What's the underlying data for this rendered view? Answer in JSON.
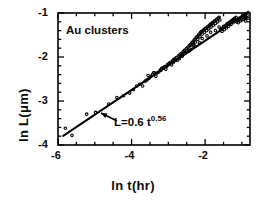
{
  "figure": {
    "series_label": "Au clusters",
    "fit_label_base": "L=0.6 t",
    "fit_label_exponent": "0.56"
  },
  "chart_data": {
    "type": "scatter",
    "title": "",
    "xlabel": "ln t(hr)",
    "ylabel": "ln L(μm)",
    "xlim": [
      -6.0,
      -0.78
    ],
    "ylim": [
      -4.0,
      -1.0
    ],
    "grid": false,
    "legend": "none",
    "xticks_major": [
      -6,
      -4,
      -2
    ],
    "xtick_labels": [
      "-6",
      "-4",
      "-2"
    ],
    "xticks_minor_step": 0.5,
    "yticks_major": [
      -1,
      -2,
      -3,
      -4
    ],
    "ytick_labels": [
      "-1",
      "-2",
      "-3",
      "-4"
    ],
    "yticks_minor_step": 0.2,
    "tick_direction": "in",
    "marker": "open-circle",
    "marker_size_px": 2.6,
    "annotations": [
      {
        "text": "Au clusters",
        "x": -5.35,
        "y": -1.33
      },
      {
        "text": "L=0.6 t^0.56",
        "x": -4.2,
        "y": -3.42
      }
    ],
    "fit": {
      "equation": "L = 0.6 t^0.56",
      "form": "power-law",
      "prefactor": 0.6,
      "exponent": 0.56,
      "log_slope": 0.56,
      "log_intercept": -0.511,
      "x_start": -5.86,
      "x_end": -0.82
    },
    "series": [
      {
        "name": "Au clusters",
        "x": [
          -5.8,
          -5.62,
          -5.22,
          -4.98,
          -4.62,
          -4.4,
          -4.22,
          -4.05,
          -3.95,
          -3.86,
          -3.78,
          -3.7,
          -3.63,
          -3.58,
          -3.52,
          -3.47,
          -3.43,
          -3.38,
          -3.34,
          -3.3,
          -3.26,
          -3.22,
          -3.18,
          -3.14,
          -3.1,
          -3.07,
          -3.03,
          -3.0,
          -2.97,
          -2.94,
          -2.91,
          -2.88,
          -2.85,
          -2.82,
          -2.79,
          -2.76,
          -2.73,
          -2.7,
          -2.67,
          -2.65,
          -2.62,
          -2.6,
          -2.57,
          -2.55,
          -2.52,
          -2.5,
          -2.47,
          -2.45,
          -2.43,
          -2.4,
          -2.38,
          -2.36,
          -2.34,
          -2.32,
          -2.3,
          -2.28,
          -2.26,
          -2.24,
          -2.22,
          -2.2,
          -2.18,
          -2.16,
          -2.14,
          -2.12,
          -2.1,
          -2.08,
          -2.06,
          -2.04,
          -2.02,
          -2.0,
          -1.98,
          -1.96,
          -1.94,
          -1.92,
          -1.9,
          -1.88,
          -1.86,
          -1.84,
          -1.82,
          -1.8,
          -1.78,
          -1.76,
          -1.74,
          -1.72,
          -1.7,
          -1.68,
          -1.66,
          -1.64,
          -1.62,
          -1.6,
          -1.58,
          -1.56,
          -1.54,
          -1.52,
          -1.5,
          -1.48,
          -1.46,
          -1.44,
          -1.42,
          -1.4,
          -1.38,
          -1.36,
          -1.34,
          -1.32,
          -1.3,
          -1.28,
          -1.26,
          -1.24,
          -1.22,
          -1.2,
          -1.18,
          -1.16,
          -1.14,
          -1.12,
          -1.1,
          -1.08,
          -1.06,
          -1.04,
          -1.02,
          -1.0,
          -0.98,
          -0.96,
          -0.94,
          -0.92,
          -0.9,
          -0.88,
          -0.86,
          -0.84,
          -3.55,
          -3.2,
          -2.86,
          -2.55,
          -2.3,
          -2.08,
          -1.85,
          -1.62,
          -1.4,
          -1.18,
          -0.98,
          -3.4,
          -3.05,
          -2.7,
          -2.42,
          -2.15,
          -1.95,
          -1.72,
          -1.5,
          -1.28,
          -1.08,
          -0.9
        ],
        "y": [
          -3.62,
          -3.78,
          -3.3,
          -3.26,
          -3.07,
          -2.92,
          -2.88,
          -2.82,
          -2.74,
          -2.66,
          -2.62,
          -2.66,
          -2.55,
          -2.52,
          -2.48,
          -2.44,
          -2.4,
          -2.36,
          -2.44,
          -2.36,
          -2.34,
          -2.3,
          -2.26,
          -2.24,
          -2.22,
          -2.28,
          -2.18,
          -2.16,
          -2.14,
          -2.12,
          -2.18,
          -2.08,
          -2.06,
          -2.04,
          -2.02,
          -2.08,
          -1.98,
          -1.96,
          -1.94,
          -1.92,
          -1.98,
          -1.88,
          -1.86,
          -1.84,
          -1.9,
          -1.8,
          -1.78,
          -1.84,
          -1.74,
          -1.72,
          -1.78,
          -1.68,
          -1.66,
          -1.72,
          -1.62,
          -1.6,
          -1.66,
          -1.56,
          -1.54,
          -1.6,
          -1.5,
          -1.48,
          -1.54,
          -1.44,
          -1.42,
          -1.48,
          -1.4,
          -1.38,
          -1.44,
          -1.36,
          -1.34,
          -1.4,
          -1.32,
          -1.3,
          -1.36,
          -1.28,
          -1.26,
          -1.32,
          -1.24,
          -1.22,
          -1.28,
          -1.2,
          -1.18,
          -1.24,
          -1.16,
          -1.14,
          -1.2,
          -1.12,
          -1.1,
          -1.16,
          -1.38,
          -1.36,
          -1.42,
          -1.34,
          -1.32,
          -1.38,
          -1.3,
          -1.28,
          -1.34,
          -1.26,
          -1.24,
          -1.3,
          -1.22,
          -1.2,
          -1.26,
          -1.18,
          -1.16,
          -1.22,
          -1.14,
          -1.12,
          -1.18,
          -1.1,
          -1.2,
          -1.16,
          -1.22,
          -1.14,
          -1.12,
          -1.18,
          -1.1,
          -1.16,
          -1.08,
          -1.14,
          -1.06,
          -1.12,
          -1.18,
          -1.1,
          -1.06,
          -1.12,
          -2.42,
          -2.3,
          -2.12,
          -1.92,
          -1.74,
          -1.58,
          -1.44,
          -1.32,
          -1.24,
          -1.16,
          -1.1,
          -2.36,
          -2.22,
          -2.04,
          -1.86,
          -1.68,
          -1.52,
          -1.4,
          -1.3,
          -1.2,
          -1.14,
          -1.08
        ]
      }
    ]
  }
}
